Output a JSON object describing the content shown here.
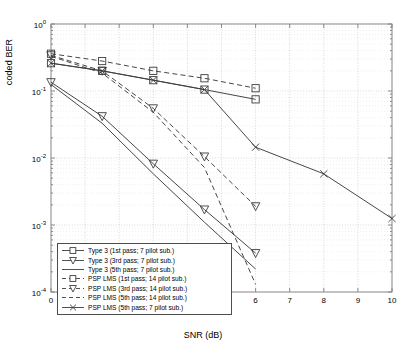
{
  "chart_data": {
    "type": "line",
    "title": "",
    "xlabel": "SNR (dB)",
    "ylabel": "coded BER",
    "xlim": [
      0,
      10
    ],
    "ylim": [
      0.0001,
      1
    ],
    "yscale": "log",
    "grid": true,
    "legend_position": "lower-left",
    "xticks": [
      "0",
      "1",
      "2",
      "3",
      "4",
      "5",
      "6",
      "7",
      "8",
      "9",
      "10"
    ],
    "yticks": [
      "10^0",
      "10^-1",
      "10^-2",
      "10^-3",
      "10^-4"
    ],
    "ytick_labels": [
      {
        "base": "10",
        "exp": "0"
      },
      {
        "base": "10",
        "exp": "-1"
      },
      {
        "base": "10",
        "exp": "-2"
      },
      {
        "base": "10",
        "exp": "-3"
      },
      {
        "base": "10",
        "exp": "-4"
      }
    ],
    "series": [
      {
        "name": "Type 3 (1st pass; 7 pilot sub.)",
        "marker": "square",
        "linestyle": "solid",
        "x": [
          0,
          1.5,
          3,
          4.5,
          6
        ],
        "values": [
          0.26,
          0.2,
          0.145,
          0.105,
          0.075
        ]
      },
      {
        "name": "Type 3 (3rd pass; 7 pilot sub.)",
        "marker": "triangle-down",
        "linestyle": "solid",
        "x": [
          0,
          1.5,
          3,
          4.5,
          6
        ],
        "values": [
          0.135,
          0.042,
          0.0082,
          0.0017,
          0.00038
        ]
      },
      {
        "name": "Type 3 (5th pass; 7 pilot sub.)",
        "marker": "none",
        "linestyle": "solid",
        "x": [
          0,
          1.5,
          3,
          4.5,
          6
        ],
        "values": [
          0.125,
          0.033,
          0.0058,
          0.0011,
          0.00022
        ]
      },
      {
        "name": "PSP  LMS (1st pass; 14 pilot sub.)",
        "marker": "square",
        "linestyle": "dashed",
        "x": [
          0,
          1.5,
          3,
          4.5,
          6
        ],
        "values": [
          0.36,
          0.28,
          0.2,
          0.155,
          0.11
        ]
      },
      {
        "name": "PSP  LMS (3rd pass; 14 pilot sub.)",
        "marker": "triangle-down",
        "linestyle": "dashed",
        "x": [
          0,
          1.5,
          3,
          4.5,
          6
        ],
        "values": [
          0.34,
          0.2,
          0.055,
          0.0105,
          0.0019
        ]
      },
      {
        "name": "PSP  LMS (5th pass; 14 pilot sub.)",
        "marker": "none",
        "linestyle": "dashed",
        "x": [
          0,
          1.5,
          3,
          4.5,
          6
        ],
        "values": [
          0.33,
          0.185,
          0.048,
          0.0072,
          0.00013
        ]
      },
      {
        "name": "PSP  LMS (5th pass; 7 pilot sub.)",
        "marker": "x",
        "linestyle": "solid",
        "x": [
          0,
          1.5,
          3,
          4.5,
          6,
          8,
          10
        ],
        "values": [
          0.26,
          0.2,
          0.145,
          0.105,
          0.0145,
          0.0058,
          0.00125
        ]
      }
    ]
  },
  "legend": {
    "items": [
      {
        "label": "Type 3 (1st pass; 7 pilot sub.)",
        "marker": "square",
        "linestyle": "solid"
      },
      {
        "label": "Type 3 (3rd pass; 7 pilot sub.)",
        "marker": "triangle-down",
        "linestyle": "solid"
      },
      {
        "label": "Type 3 (5th pass; 7 pilot sub.)",
        "marker": "none",
        "linestyle": "solid"
      },
      {
        "label": "PSP  LMS (1st pass; 14 pilot sub.)",
        "marker": "square",
        "linestyle": "dashed"
      },
      {
        "label": "PSP  LMS (3rd pass; 14 pilot sub.)",
        "marker": "triangle-down",
        "linestyle": "dashed"
      },
      {
        "label": "PSP  LMS (5th pass; 14 pilot sub.)",
        "marker": "none",
        "linestyle": "dashed"
      },
      {
        "label": "PSP  LMS (5th pass; 7 pilot sub.)",
        "marker": "x",
        "linestyle": "solid"
      }
    ]
  },
  "colors": {
    "line": "#3d3d3d",
    "axis": "#808080",
    "grid": "#c8c8c8",
    "background": "#ffffff"
  }
}
